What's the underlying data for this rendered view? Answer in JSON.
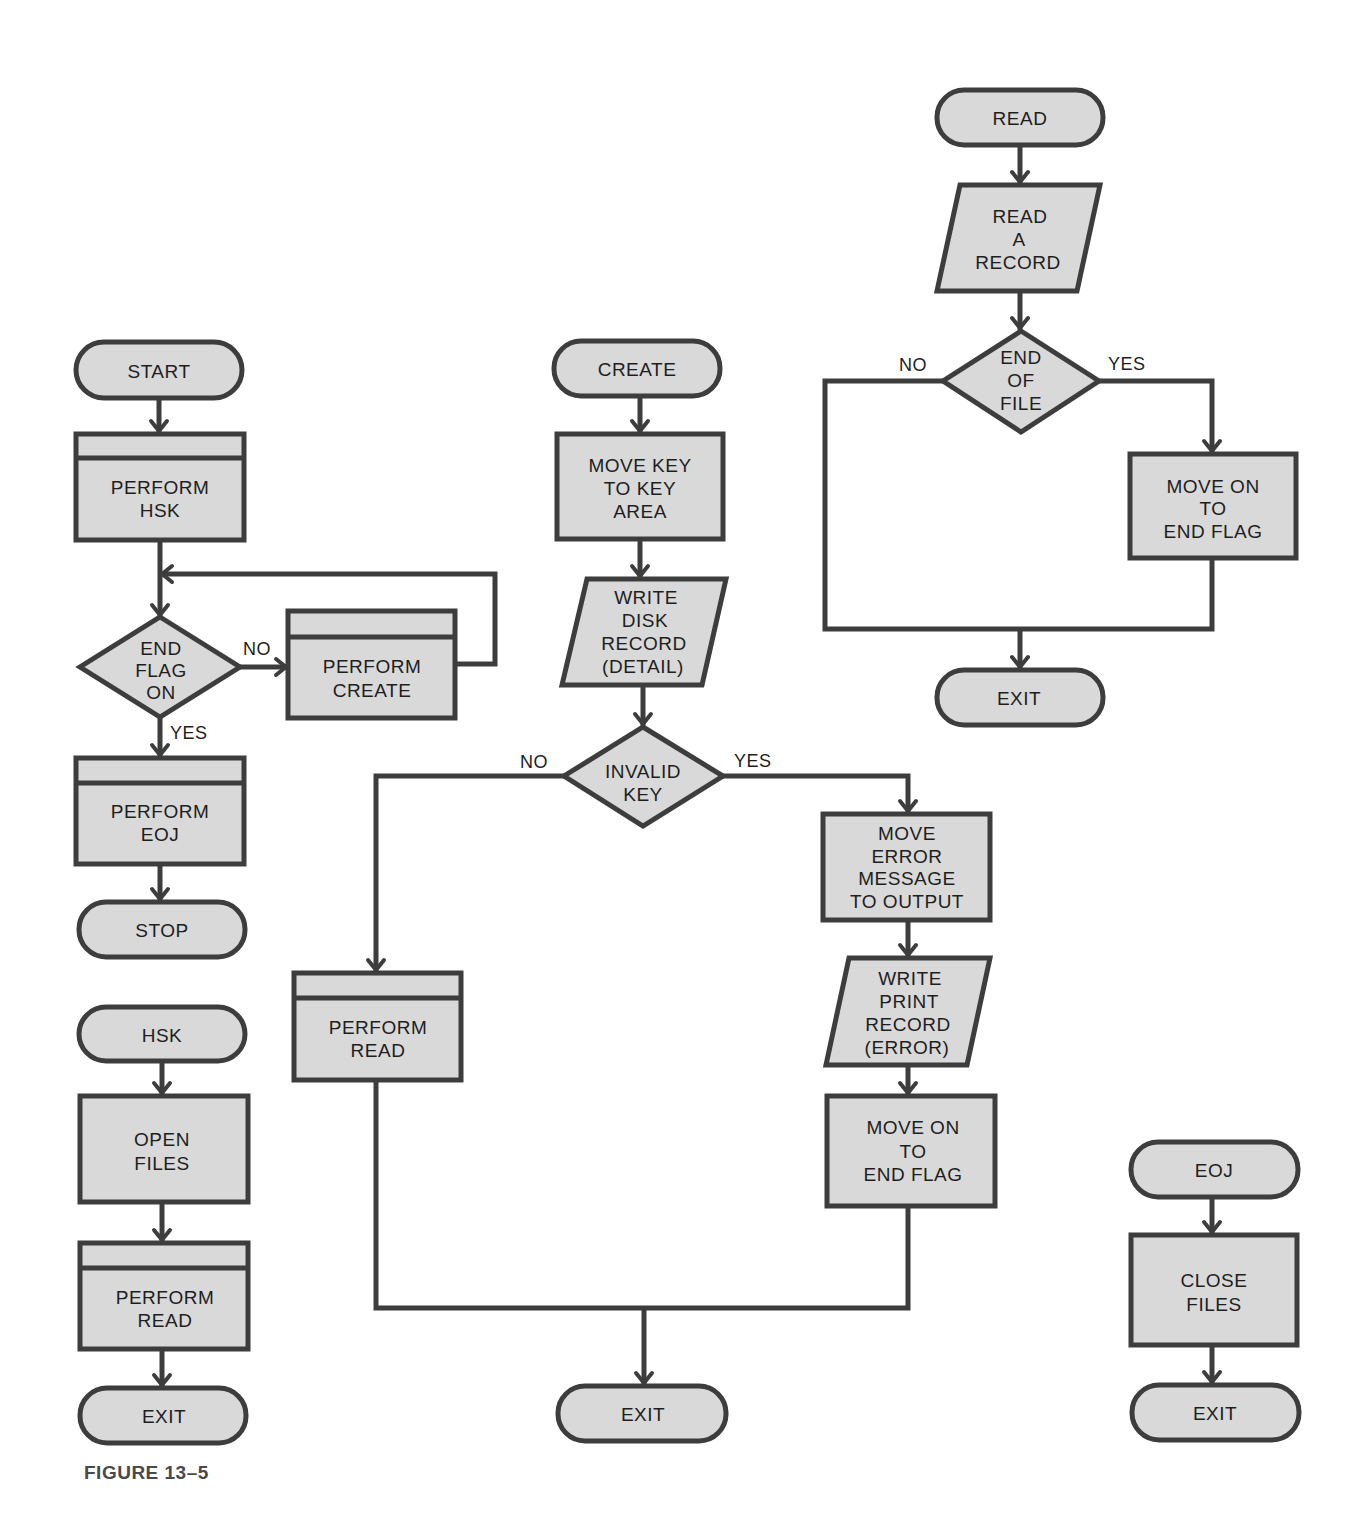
{
  "figure": {
    "caption": "FIGURE 13–5",
    "colors": {
      "line": "#3d3d3d",
      "fill": "#d9d9d9",
      "text": "#1e1e1e",
      "background": "#ffffff"
    }
  },
  "main_flow": {
    "start": "START",
    "perform_hsk": [
      "PERFORM",
      "HSK"
    ],
    "decision": [
      "END",
      "FLAG",
      "ON"
    ],
    "no": "NO",
    "yes": "YES",
    "perform_create": [
      "PERFORM",
      "CREATE"
    ],
    "perform_eoj": [
      "PERFORM",
      "EOJ"
    ],
    "stop": "STOP"
  },
  "hsk_flow": {
    "entry": "HSK",
    "open_files": [
      "OPEN",
      "FILES"
    ],
    "perform_read": [
      "PERFORM",
      "READ"
    ],
    "exit": "EXIT"
  },
  "create_flow": {
    "entry": "CREATE",
    "move_key": [
      "MOVE KEY",
      "TO KEY",
      "AREA"
    ],
    "write_disk": [
      "WRITE",
      "DISK",
      "RECORD",
      "(DETAIL)"
    ],
    "decision": [
      "INVALID",
      "KEY"
    ],
    "no": "NO",
    "yes": "YES",
    "perform_read": [
      "PERFORM",
      "READ"
    ],
    "move_error": [
      "MOVE",
      "ERROR",
      "MESSAGE",
      "TO OUTPUT"
    ],
    "write_print": [
      "WRITE",
      "PRINT",
      "RECORD",
      "(ERROR)"
    ],
    "move_on": [
      "MOVE ON",
      "TO",
      "END FLAG"
    ],
    "exit": "EXIT"
  },
  "read_flow": {
    "entry": "READ",
    "read_record": [
      "READ",
      "A",
      "RECORD"
    ],
    "decision": [
      "END",
      "OF",
      "FILE"
    ],
    "no": "NO",
    "yes": "YES",
    "move_on": [
      "MOVE ON",
      "TO",
      "END FLAG"
    ],
    "exit": "EXIT"
  },
  "eoj_flow": {
    "entry": "EOJ",
    "close_files": [
      "CLOSE",
      "FILES"
    ],
    "exit": "EXIT"
  }
}
